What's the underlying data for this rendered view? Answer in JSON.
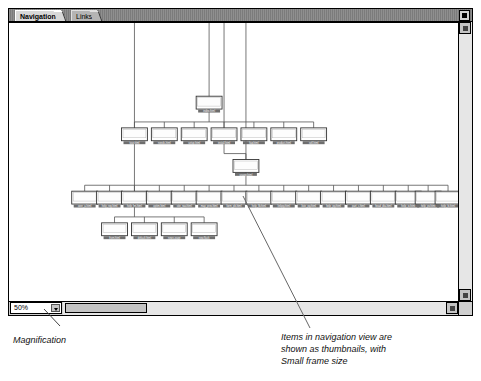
{
  "window": {
    "tabs": [
      {
        "label": "Navigation",
        "active": true
      },
      {
        "label": "Links",
        "active": false
      }
    ],
    "close_box": "close-box"
  },
  "status_bar": {
    "magnification_value": "50%",
    "magnification_options": [
      "25%",
      "50%",
      "75%",
      "100%",
      "200%"
    ]
  },
  "annotations": {
    "left": "Magnification",
    "right": "Items in navigation view are\nshown as thumbnails, with\nSmall frame size"
  },
  "tree": {
    "description": "Site navigation map drawn as thumbnail frames connected by elbow links",
    "node_size": {
      "w": 26,
      "h": 13
    },
    "rows": [
      {
        "row": 1,
        "y": 88,
        "nodes": [
          {
            "label": "index.html",
            "x": 188
          }
        ]
      },
      {
        "row": 2,
        "y": 120,
        "nodes": [
          {
            "label": "tour.html",
            "x": 113
          },
          {
            "label": "needs.html",
            "x": 143
          },
          {
            "label": "setup.html",
            "x": 173
          },
          {
            "label": "install.html",
            "x": 203
          },
          {
            "label": "faq.html",
            "x": 233
          },
          {
            "label": "product.html",
            "x": 263
          },
          {
            "label": "sell.html",
            "x": 293
          }
        ]
      },
      {
        "row": 3,
        "y": 152,
        "nodes": [
          {
            "label": "usage.html",
            "x": 225
          }
        ]
      },
      {
        "row": 4,
        "y": 184,
        "nodes": [
          {
            "label": "over_a.html",
            "x": 63
          },
          {
            "label": "help_reg.html",
            "x": 88
          },
          {
            "label": "help_fm.html",
            "x": 113
          },
          {
            "label": "optim.html",
            "x": 138
          },
          {
            "label": "site_nav.html",
            "x": 163
          },
          {
            "label": "map_prev.html",
            "x": 188
          },
          {
            "label": "form_pb.html",
            "x": 213
          },
          {
            "label": "help_fb.html",
            "x": 238
          },
          {
            "label": "linkpg.html",
            "x": 263
          },
          {
            "label": "liste_pg.html",
            "x": 288
          },
          {
            "label": "help_pg.html",
            "x": 313
          },
          {
            "label": "part_c.html",
            "x": 338
          },
          {
            "label": "head_dta.html",
            "x": 363
          },
          {
            "label": "help_ix.html",
            "x": 388
          },
          {
            "label": "help_pv.html",
            "x": 408
          },
          {
            "label": "help_fx.html",
            "x": 428
          }
        ]
      },
      {
        "row": 5,
        "y": 216,
        "nodes": [
          {
            "label": "from.html",
            "x": 93
          },
          {
            "label": "default.html",
            "x": 123
          },
          {
            "label": "news.page",
            "x": 153
          },
          {
            "label": "new.flash",
            "x": 183
          }
        ]
      }
    ]
  }
}
